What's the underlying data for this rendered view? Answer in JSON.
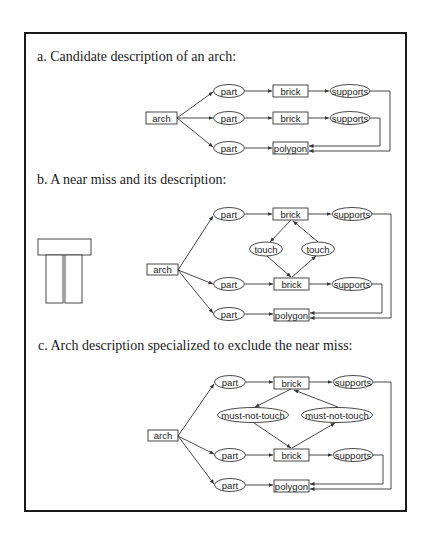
{
  "sections": {
    "a": {
      "heading": "a. Candidate description of an arch:"
    },
    "b": {
      "heading": "b. A near miss and its description:"
    },
    "c": {
      "heading": "c. Arch description specialized to exclude the near miss:"
    }
  },
  "labels": {
    "arch": "arch",
    "part": "part",
    "brick": "brick",
    "supports": "supports",
    "polygon": "polygon",
    "touch": "touch",
    "must_not_touch": "must-not-touch"
  },
  "colors": {
    "line": "#333333",
    "border": "#1a1a1a"
  }
}
